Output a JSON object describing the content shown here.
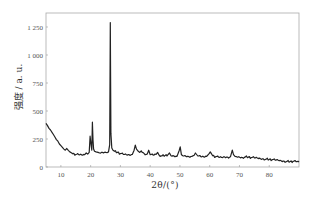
{
  "chart_data": {
    "type": "line",
    "title": "",
    "xlabel": "2θ/(°)",
    "ylabel": "强度 / a. u.",
    "xlim": [
      5,
      90
    ],
    "ylim": [
      0,
      1350
    ],
    "xticks": [
      10,
      20,
      30,
      40,
      50,
      60,
      70,
      80
    ],
    "yticks": [
      0,
      250,
      500,
      750,
      1000,
      1250
    ],
    "ytick_labels": [
      "0",
      "250",
      "500",
      "750",
      "1 000",
      "1 250"
    ],
    "grid": false,
    "legend": null,
    "series": [
      {
        "name": "XRD pattern",
        "color": "#222222",
        "x": [
          5,
          5.5,
          6,
          6.5,
          7,
          7.5,
          8,
          8.5,
          9,
          9.5,
          10,
          10.5,
          11,
          11.5,
          12,
          12.5,
          13,
          13.5,
          14,
          15,
          16,
          17,
          18,
          18.5,
          19,
          19.5,
          19.8,
          20.1,
          20.4,
          20.6,
          20.8,
          21.0,
          21.3,
          21.8,
          22.5,
          23,
          24,
          25,
          25.5,
          26,
          26.4,
          26.6,
          26.8,
          27.1,
          27.5,
          28,
          29,
          30,
          31,
          32,
          33,
          34,
          34.6,
          35,
          35.4,
          36,
          36.5,
          37,
          38,
          39,
          39.5,
          40,
          41,
          42,
          42.5,
          43,
          44,
          45,
          46,
          46.5,
          47,
          48,
          49,
          49.8,
          50.1,
          50.5,
          51,
          52,
          53,
          54,
          54.8,
          55.2,
          56,
          57,
          58,
          59,
          59.8,
          60.2,
          61,
          62,
          63,
          64,
          65,
          66,
          67,
          67.6,
          68,
          68.5,
          69,
          70,
          71,
          72,
          73,
          74,
          75,
          76,
          77,
          78,
          79,
          80,
          81,
          82,
          83,
          84,
          85,
          86,
          87,
          88,
          89,
          90
        ],
        "y": [
          390,
          370,
          345,
          330,
          310,
          290,
          268,
          245,
          230,
          205,
          190,
          175,
          160,
          150,
          165,
          148,
          135,
          128,
          118,
          112,
          110,
          108,
          110,
          125,
          115,
          130,
          275,
          210,
          150,
          400,
          240,
          160,
          140,
          135,
          130,
          125,
          130,
          132,
          128,
          135,
          200,
          1290,
          300,
          170,
          150,
          140,
          130,
          120,
          112,
          110,
          108,
          112,
          150,
          195,
          160,
          140,
          130,
          145,
          120,
          115,
          150,
          110,
          105,
          112,
          130,
          105,
          100,
          102,
          110,
          125,
          100,
          98,
          95,
          150,
          180,
          110,
          100,
          95,
          92,
          95,
          105,
          125,
          98,
          92,
          90,
          95,
          120,
          135,
          100,
          92,
          88,
          85,
          90,
          88,
          92,
          150,
          110,
          95,
          92,
          88,
          85,
          90,
          88,
          85,
          82,
          80,
          75,
          72,
          70,
          68,
          65,
          62,
          60,
          55,
          52,
          50,
          48,
          50,
          48,
          45
        ]
      }
    ],
    "annotations": []
  }
}
